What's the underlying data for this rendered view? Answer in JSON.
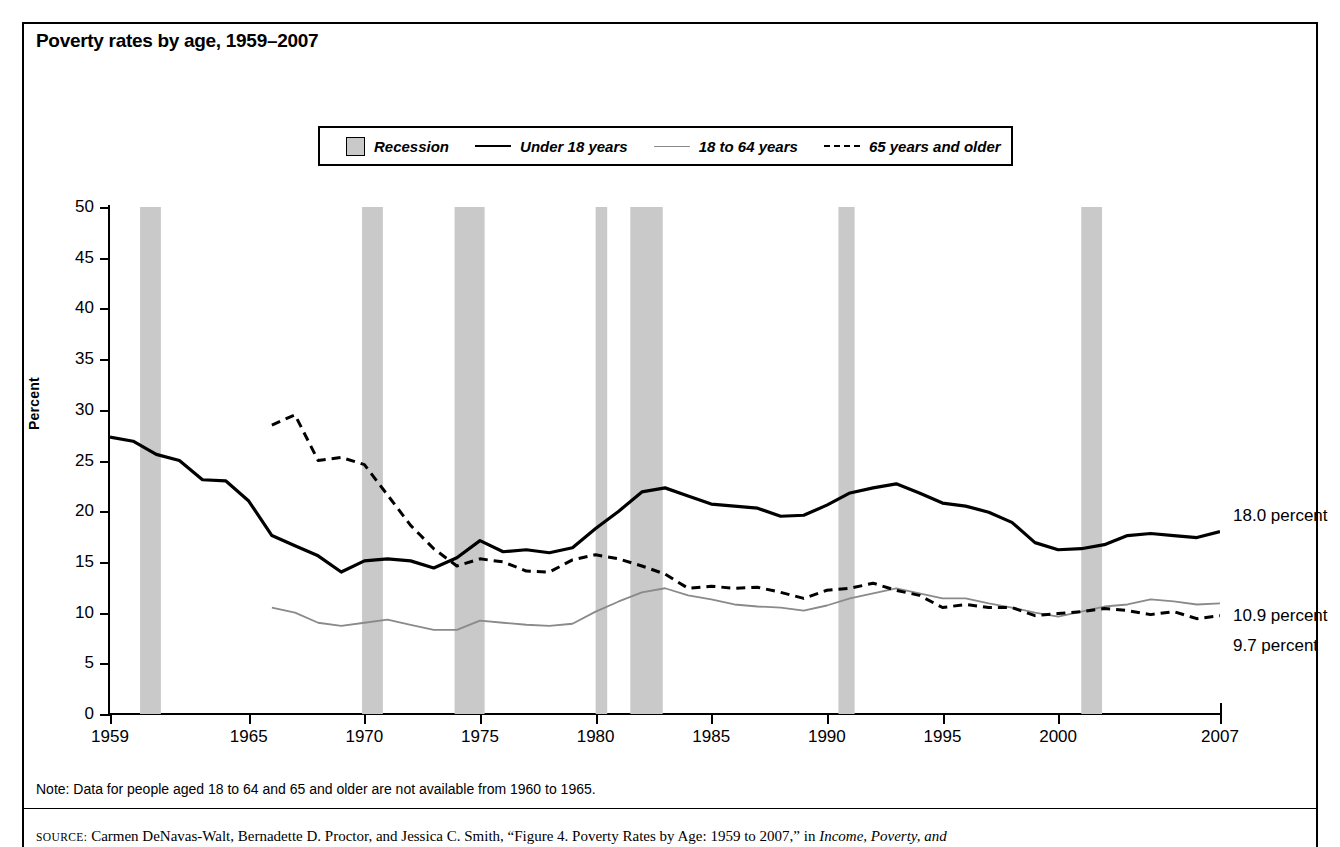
{
  "title": "Poverty rates by age, 1959–2007",
  "legend": {
    "items": [
      {
        "name": "recession",
        "label": "Recession",
        "marker": "gray-box"
      },
      {
        "name": "under-18",
        "label": "Under 18 years",
        "marker": "solid-line"
      },
      {
        "name": "18-to-64",
        "label": "18 to 64 years",
        "marker": "thin-line"
      },
      {
        "name": "65-and-older",
        "label": "65 years and older",
        "marker": "dashed-line"
      }
    ]
  },
  "annotations": [
    {
      "name": "under-18-endpoint",
      "label": "18.0 percent"
    },
    {
      "name": "18-to-64-endpoint",
      "label": "10.9 percent"
    },
    {
      "name": "65-and-older-endpoint",
      "label": "9.7 percent"
    }
  ],
  "note": "Note: Data for people aged 18 to 64 and 65 and older are not available from 1960 to 1965.",
  "source": {
    "label": "SOURCE:",
    "text": "Carmen DeNavas-Walt, Bernadette D. Proctor, and Jessica C. Smith, “Figure 4. Poverty Rates by Age: 1959 to 2007,” in ",
    "italic": "Income, Poverty, and"
  },
  "colors": {
    "recession_band": "#c9c9c9",
    "under_18_line": "#000000",
    "age_18_64_line": "#8a8a8a",
    "age_65_plus_line": "#000000",
    "frame": "#000000"
  },
  "chart_data": {
    "type": "line",
    "title": "Poverty rates by age, 1959–2007",
    "xlabel": "",
    "ylabel": "Percent",
    "xlim": [
      1959,
      2007
    ],
    "ylim": [
      0,
      50
    ],
    "ytick_values": [
      0,
      5,
      10,
      15,
      20,
      25,
      30,
      35,
      40,
      45,
      50
    ],
    "xtick_values": [
      1959,
      1965,
      1970,
      1975,
      1980,
      1985,
      1990,
      1995,
      2000,
      2007
    ],
    "grid": false,
    "legend_position": "top-center",
    "series": [
      {
        "name": "Under 18 years",
        "style": "solid",
        "color": "#000000",
        "x": [
          1959,
          1960,
          1961,
          1962,
          1963,
          1964,
          1965,
          1966,
          1967,
          1968,
          1969,
          1970,
          1971,
          1972,
          1973,
          1974,
          1975,
          1976,
          1977,
          1978,
          1979,
          1980,
          1981,
          1982,
          1983,
          1984,
          1985,
          1986,
          1987,
          1988,
          1989,
          1990,
          1991,
          1992,
          1993,
          1994,
          1995,
          1996,
          1997,
          1998,
          1999,
          2000,
          2001,
          2002,
          2003,
          2004,
          2005,
          2006,
          2007
        ],
        "y": [
          27.3,
          26.9,
          25.6,
          25.0,
          23.1,
          23.0,
          21.0,
          17.6,
          16.6,
          15.6,
          14.0,
          15.1,
          15.3,
          15.1,
          14.4,
          15.4,
          17.1,
          16.0,
          16.2,
          15.9,
          16.4,
          18.3,
          20.0,
          21.9,
          22.3,
          21.5,
          20.7,
          20.5,
          20.3,
          19.5,
          19.6,
          20.6,
          21.8,
          22.3,
          22.7,
          21.8,
          20.8,
          20.5,
          19.9,
          18.9,
          16.9,
          16.2,
          16.3,
          16.7,
          17.6,
          17.8,
          17.6,
          17.4,
          18.0
        ]
      },
      {
        "name": "18 to 64 years",
        "style": "thin-solid",
        "color": "#8a8a8a",
        "x": [
          1966,
          1967,
          1968,
          1969,
          1970,
          1971,
          1972,
          1973,
          1974,
          1975,
          1976,
          1977,
          1978,
          1979,
          1980,
          1981,
          1982,
          1983,
          1984,
          1985,
          1986,
          1987,
          1988,
          1989,
          1990,
          1991,
          1992,
          1993,
          1994,
          1995,
          1996,
          1997,
          1998,
          1999,
          2000,
          2001,
          2002,
          2003,
          2004,
          2005,
          2006,
          2007
        ],
        "y": [
          10.5,
          10.0,
          9.0,
          8.7,
          9.0,
          9.3,
          8.8,
          8.3,
          8.3,
          9.2,
          9.0,
          8.8,
          8.7,
          8.9,
          10.1,
          11.1,
          12.0,
          12.4,
          11.7,
          11.3,
          10.8,
          10.6,
          10.5,
          10.2,
          10.7,
          11.4,
          11.9,
          12.4,
          11.9,
          11.4,
          11.4,
          10.9,
          10.5,
          10.0,
          9.6,
          10.1,
          10.6,
          10.8,
          11.3,
          11.1,
          10.8,
          10.9
        ]
      },
      {
        "name": "65 years and older",
        "style": "dashed",
        "color": "#000000",
        "x": [
          1966,
          1967,
          1968,
          1969,
          1970,
          1971,
          1972,
          1973,
          1974,
          1975,
          1976,
          1977,
          1978,
          1979,
          1980,
          1981,
          1982,
          1983,
          1984,
          1985,
          1986,
          1987,
          1988,
          1989,
          1990,
          1991,
          1992,
          1993,
          1994,
          1995,
          1996,
          1997,
          1998,
          1999,
          2000,
          2001,
          2002,
          2003,
          2004,
          2005,
          2006,
          2007
        ],
        "y": [
          28.5,
          29.5,
          25.0,
          25.3,
          24.6,
          21.6,
          18.6,
          16.3,
          14.6,
          15.3,
          15.0,
          14.1,
          14.0,
          15.2,
          15.7,
          15.3,
          14.6,
          13.8,
          12.4,
          12.6,
          12.4,
          12.5,
          12.0,
          11.4,
          12.2,
          12.4,
          12.9,
          12.2,
          11.7,
          10.5,
          10.8,
          10.5,
          10.5,
          9.7,
          9.9,
          10.1,
          10.4,
          10.2,
          9.8,
          10.1,
          9.4,
          9.7
        ]
      }
    ],
    "recessions": [
      {
        "start": 1960.3,
        "end": 1961.2
      },
      {
        "start": 1969.9,
        "end": 1970.8
      },
      {
        "start": 1973.9,
        "end": 1975.2
      },
      {
        "start": 1980.0,
        "end": 1980.5
      },
      {
        "start": 1981.5,
        "end": 1982.9
      },
      {
        "start": 1990.5,
        "end": 1991.2
      },
      {
        "start": 2001.0,
        "end": 2001.9
      }
    ]
  }
}
